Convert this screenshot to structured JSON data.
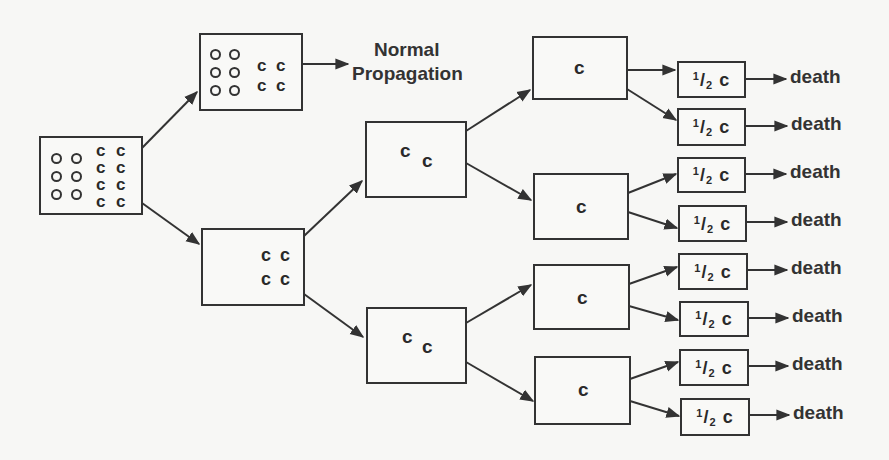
{
  "diagram": {
    "type": "tree-flow",
    "root": {
      "label": "oo cc / oo cc / oo cc / cc",
      "normal_cells": 6,
      "c_cells": 8,
      "c_glyph": "c",
      "o_glyph": "o"
    },
    "upper_branch": {
      "normal_cells": 6,
      "c_cells": 4,
      "c_glyph": "c",
      "outcome": "Normal Propagation"
    },
    "lower_branch": {
      "c_cells": 4,
      "c_glyph": "c",
      "children": [
        {
          "label_a": "c",
          "label_b": "c",
          "children": [
            {
              "label": "c"
            },
            {
              "label": "c"
            }
          ]
        },
        {
          "label_a": "c",
          "label_b": "c",
          "children": [
            {
              "label": "c"
            },
            {
              "label": "c"
            }
          ]
        }
      ]
    },
    "normal_propagation_label": {
      "line1": "Normal",
      "line2": "Propagation"
    },
    "single_c_boxes": [
      "c",
      "c",
      "c",
      "c"
    ],
    "half_c_boxes": [
      {
        "frac_num": "1",
        "frac_slash": "/",
        "frac_den": "2",
        "letter": "c"
      },
      {
        "frac_num": "1",
        "frac_slash": "/",
        "frac_den": "2",
        "letter": "c"
      },
      {
        "frac_num": "1",
        "frac_slash": "/",
        "frac_den": "2",
        "letter": "c"
      },
      {
        "frac_num": "1",
        "frac_slash": "/",
        "frac_den": "2",
        "letter": "c"
      },
      {
        "frac_num": "1",
        "frac_slash": "/",
        "frac_den": "2",
        "letter": "c"
      },
      {
        "frac_num": "1",
        "frac_slash": "/",
        "frac_den": "2",
        "letter": "c"
      },
      {
        "frac_num": "1",
        "frac_slash": "/",
        "frac_den": "2",
        "letter": "c"
      },
      {
        "frac_num": "1",
        "frac_slash": "/",
        "frac_den": "2",
        "letter": "c"
      }
    ],
    "outcomes": [
      "death",
      "death",
      "death",
      "death",
      "death",
      "death",
      "death",
      "death"
    ],
    "colors": {
      "ink": "#333333",
      "paper": "#f7f7f5"
    }
  }
}
